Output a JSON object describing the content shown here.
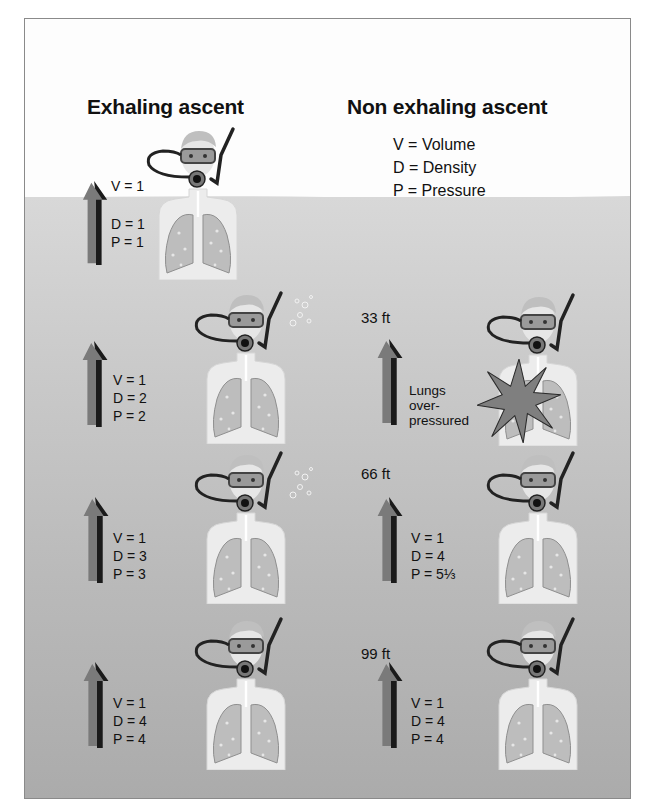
{
  "headings": {
    "left": "Exhaling ascent",
    "right": "Non exhaling ascent"
  },
  "legend": [
    "V = Volume",
    "D = Density",
    "P = Pressure"
  ],
  "exhaling": [
    {
      "depth": "",
      "v": "V = 1",
      "d": "D = 1",
      "p": "P = 1",
      "bubbles": false
    },
    {
      "depth": "",
      "v": "V = 1",
      "d": "D = 2",
      "p": "P = 2",
      "bubbles": true
    },
    {
      "depth": "",
      "v": "V = 1",
      "d": "D = 3",
      "p": "P = 3",
      "bubbles": true
    },
    {
      "depth": "",
      "v": "V = 1",
      "d": "D = 4",
      "p": "P = 4",
      "bubbles": false
    }
  ],
  "non_exhaling": [
    {
      "depth": "33 ft",
      "note": [
        "Lungs",
        "over-",
        "pressured"
      ],
      "burst": true
    },
    {
      "depth": "66 ft",
      "v": "V = 1",
      "d": "D = 4",
      "p": "P = 5⅓"
    },
    {
      "depth": "99 ft",
      "v": "V = 1",
      "d": "D = 4",
      "p": "P = 4"
    }
  ],
  "colors": {
    "arrow_light": "#7a7a7a",
    "arrow_dark": "#1a1a1a",
    "water_top": "#d8d8d8",
    "water_bottom": "#ababab",
    "skin": "#ececec",
    "lung": "#bdbdbd"
  }
}
